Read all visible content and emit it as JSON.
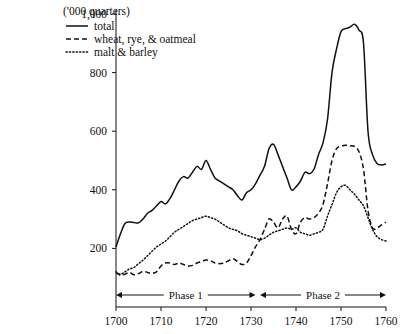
{
  "chart_data": {
    "type": "line",
    "title": "",
    "units_note": "('000 quarters)",
    "xlabel": "",
    "ylabel": "",
    "xlim": [
      1700,
      1760
    ],
    "ylim": [
      0,
      1000
    ],
    "yticks": [
      200,
      400,
      600,
      800,
      1000
    ],
    "ytick_labels": [
      "200",
      "400",
      "600",
      "800",
      "1,000"
    ],
    "xticks": [
      1700,
      1710,
      1720,
      1730,
      1740,
      1750,
      1760
    ],
    "xtick_labels": [
      "1700",
      "1710",
      "1720",
      "1730",
      "1740",
      "1750",
      "1760"
    ],
    "grid": false,
    "legend_position": "top-left",
    "x": [
      1700,
      1701,
      1702,
      1703,
      1704,
      1705,
      1706,
      1707,
      1708,
      1709,
      1710,
      1711,
      1712,
      1713,
      1714,
      1715,
      1716,
      1717,
      1718,
      1719,
      1720,
      1721,
      1722,
      1723,
      1724,
      1725,
      1726,
      1727,
      1728,
      1729,
      1730,
      1731,
      1732,
      1733,
      1734,
      1735,
      1736,
      1737,
      1738,
      1739,
      1740,
      1741,
      1742,
      1743,
      1744,
      1745,
      1746,
      1747,
      1748,
      1749,
      1750,
      1751,
      1752,
      1753,
      1754,
      1755,
      1756,
      1757,
      1758,
      1759,
      1760
    ],
    "series": [
      {
        "name": "total",
        "style": "solid",
        "values": [
          205,
          250,
          285,
          290,
          288,
          287,
          300,
          320,
          330,
          345,
          360,
          352,
          370,
          400,
          430,
          445,
          440,
          460,
          480,
          470,
          500,
          470,
          440,
          430,
          420,
          410,
          400,
          380,
          365,
          390,
          400,
          420,
          450,
          480,
          540,
          555,
          520,
          480,
          440,
          400,
          410,
          430,
          460,
          455,
          470,
          520,
          560,
          640,
          800,
          880,
          940,
          950,
          955,
          965,
          945,
          900,
          600,
          520,
          490,
          485,
          488
        ]
      },
      {
        "name": "wheat, rye, & oatmeal",
        "style": "dashed",
        "values": [
          118,
          108,
          112,
          118,
          110,
          114,
          122,
          118,
          115,
          120,
          140,
          150,
          150,
          145,
          150,
          145,
          140,
          142,
          150,
          155,
          160,
          158,
          150,
          148,
          150,
          158,
          165,
          155,
          145,
          150,
          175,
          205,
          230,
          265,
          300,
          290,
          270,
          300,
          310,
          265,
          250,
          290,
          305,
          300,
          305,
          320,
          350,
          420,
          500,
          540,
          548,
          552,
          550,
          548,
          530,
          470,
          330,
          270,
          270,
          280,
          290
        ]
      },
      {
        "name": "malt & barley",
        "style": "dotted",
        "values": [
          120,
          112,
          120,
          130,
          135,
          148,
          160,
          175,
          190,
          205,
          215,
          225,
          240,
          255,
          265,
          275,
          285,
          295,
          300,
          305,
          310,
          305,
          300,
          290,
          280,
          270,
          265,
          260,
          250,
          245,
          240,
          235,
          230,
          235,
          245,
          255,
          260,
          265,
          270,
          265,
          270,
          255,
          250,
          245,
          250,
          255,
          265,
          310,
          350,
          390,
          410,
          415,
          400,
          385,
          365,
          345,
          305,
          265,
          240,
          230,
          225
        ]
      }
    ],
    "annotations": [
      {
        "label": "Phase 1",
        "x_start": 1700,
        "x_end": 1731
      },
      {
        "label": "Phase 2",
        "x_start": 1732,
        "x_end": 1760
      }
    ]
  },
  "legend": {
    "units": "('000 quarters)",
    "items": [
      {
        "label": "total",
        "style": "solid"
      },
      {
        "label": "wheat, rye, & oatmeal",
        "style": "dashed"
      },
      {
        "label": "malt & barley",
        "style": "dotted"
      }
    ]
  }
}
